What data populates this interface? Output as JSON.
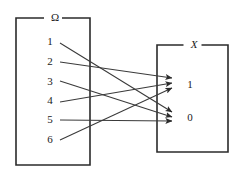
{
  "figure": {
    "kind": "mapping-diagram",
    "background_color": "#ffffff",
    "line_color": "#3a3a3a",
    "box_color": "#2b2b2b",
    "text_color": "#1a1a1a"
  },
  "domain_set": {
    "label": "Ω",
    "box": {
      "x": 16,
      "y": 18,
      "width": 74,
      "height": 147
    },
    "label_position": {
      "x": 55,
      "y": 18
    },
    "elements": [
      {
        "id": "omega-1",
        "label": "1",
        "x": 50,
        "y": 42
      },
      {
        "id": "omega-2",
        "label": "2",
        "x": 50,
        "y": 62
      },
      {
        "id": "omega-3",
        "label": "3",
        "x": 50,
        "y": 82
      },
      {
        "id": "omega-4",
        "label": "4",
        "x": 50,
        "y": 101
      },
      {
        "id": "omega-5",
        "label": "5",
        "x": 50,
        "y": 120
      },
      {
        "id": "omega-6",
        "label": "6",
        "x": 50,
        "y": 140
      }
    ]
  },
  "codomain_set": {
    "label": "X",
    "box": {
      "x": 157,
      "y": 45,
      "width": 71,
      "height": 107
    },
    "label_position": {
      "x": 194,
      "y": 45
    },
    "elements": [
      {
        "id": "x-one",
        "label": "1",
        "x": 190,
        "y": 85
      },
      {
        "id": "x-zero",
        "label": "0",
        "x": 190,
        "y": 118
      }
    ]
  },
  "mappings": [
    {
      "id": "map-1-to-0",
      "from": "1",
      "to": "0",
      "x1": 60,
      "y1": 43,
      "x2": 172,
      "y2": 112
    },
    {
      "id": "map-2-to-1",
      "from": "2",
      "to": "1",
      "x1": 60,
      "y1": 62,
      "x2": 172,
      "y2": 78
    },
    {
      "id": "map-3-to-0",
      "from": "3",
      "to": "0",
      "x1": 60,
      "y1": 81,
      "x2": 172,
      "y2": 117
    },
    {
      "id": "map-4-to-1",
      "from": "4",
      "to": "1",
      "x1": 60,
      "y1": 102,
      "x2": 172,
      "y2": 83
    },
    {
      "id": "map-5-to-0",
      "from": "5",
      "to": "0",
      "x1": 60,
      "y1": 120,
      "x2": 172,
      "y2": 121
    },
    {
      "id": "map-6-to-1",
      "from": "6",
      "to": "1",
      "x1": 60,
      "y1": 140,
      "x2": 172,
      "y2": 88
    }
  ]
}
